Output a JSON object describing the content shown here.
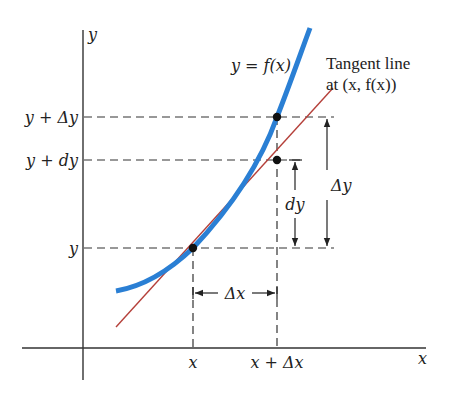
{
  "diagram": {
    "axes": {
      "x_label": "x",
      "y_label": "y"
    },
    "curve_label": "y = f(x)",
    "tangent_label_line1": "Tangent line",
    "tangent_label_line2": "at (x, f(x))",
    "y_ticks": {
      "y_plus_delta_y": "y + Δy",
      "y_plus_dy": "y + dy",
      "y": "y"
    },
    "x_ticks": {
      "x": "x",
      "x_plus_delta_x": "x + Δx"
    },
    "dimension_labels": {
      "delta_x": "Δx",
      "dy": "dy",
      "delta_y": "Δy"
    },
    "colors": {
      "curve": "#2a7fd4",
      "tangent": "#b5403a",
      "axes": "#333333",
      "dashed": "#333333",
      "points": "#111111"
    }
  }
}
